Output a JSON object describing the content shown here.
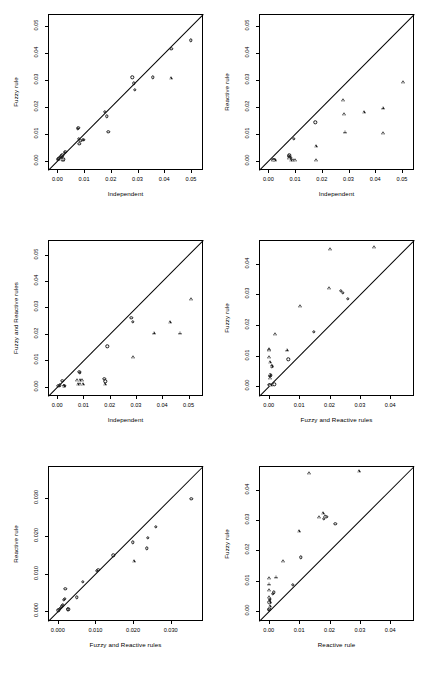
{
  "figure": {
    "type": "scatter-matrix",
    "panel_count": 6,
    "marker_names": [
      "circle-marker",
      "triangle-marker"
    ],
    "reference_line": "y = x identity line"
  },
  "chart_data": [
    {
      "id": "panel-1",
      "type": "scatter",
      "title": "",
      "xlabel": "Independent",
      "ylabel": "Fuzzy rule",
      "xlim": [
        -0.0035,
        0.0545
      ],
      "ylim": [
        -0.0035,
        0.0545
      ],
      "xticks": [
        0.0,
        0.01,
        0.02,
        0.03,
        0.04,
        0.05
      ],
      "xticklabels": [
        "0.00",
        "0.01",
        "0.02",
        "0.03",
        "0.04",
        "0.05"
      ],
      "yticks": [
        0.0,
        0.01,
        0.02,
        0.03,
        0.04,
        0.05
      ],
      "yticklabels": [
        "0.00",
        "0.01",
        "0.02",
        "0.03",
        "0.04",
        "0.05"
      ],
      "grid": false,
      "legend": "none",
      "identity_line": true,
      "series": [
        {
          "name": "circle",
          "marker": "circle",
          "points": [
            [
              0.0002,
              0.0004
            ],
            [
              0.0004,
              0.0006
            ],
            [
              0.0007,
              0.0009
            ],
            [
              0.001,
              0.0011
            ],
            [
              0.0013,
              0.0015
            ],
            [
              0.0015,
              0.0016
            ],
            [
              0.0019,
              0.002
            ],
            [
              0.0021,
              0.0004
            ],
            [
              0.0022,
              0.0005
            ],
            [
              0.0027,
              0.0029
            ],
            [
              0.003,
              0.0032
            ],
            [
              0.0077,
              0.0119
            ],
            [
              0.0078,
              0.0121
            ],
            [
              0.0081,
              0.0081
            ],
            [
              0.0082,
              0.0063
            ],
            [
              0.0086,
              0.0073
            ],
            [
              0.0095,
              0.0077
            ],
            [
              0.0099,
              0.0078
            ],
            [
              0.0177,
              0.0182
            ],
            [
              0.0184,
              0.0164
            ],
            [
              0.019,
              0.0106
            ],
            [
              0.0281,
              0.0309
            ],
            [
              0.0285,
              0.0287
            ],
            [
              0.0289,
              0.0263
            ],
            [
              0.0358,
              0.0309
            ],
            [
              0.0427,
              0.0416
            ],
            [
              0.05,
              0.0447
            ]
          ]
        },
        {
          "name": "triangle",
          "marker": "triangle",
          "points": [
            [
              0.0014,
              0.0006
            ],
            [
              0.0022,
              0.0004
            ],
            [
              0.0425,
              0.0306
            ]
          ]
        }
      ]
    },
    {
      "id": "panel-2",
      "type": "scatter",
      "title": "",
      "xlabel": "Independent",
      "ylabel": "Reactive rule",
      "xlim": [
        -0.0035,
        0.0545
      ],
      "ylim": [
        -0.0035,
        0.0545
      ],
      "xticks": [
        0.0,
        0.01,
        0.02,
        0.03,
        0.04,
        0.05
      ],
      "xticklabels": [
        "0.00",
        "0.01",
        "0.02",
        "0.03",
        "0.04",
        "0.05"
      ],
      "yticks": [
        0.0,
        0.01,
        0.02,
        0.03,
        0.04,
        0.05
      ],
      "yticklabels": [
        "0.00",
        "0.01",
        "0.02",
        "0.03",
        "0.04",
        "0.05"
      ],
      "grid": false,
      "legend": "none",
      "identity_line": true,
      "series": [
        {
          "name": "circle",
          "marker": "circle",
          "points": [
            [
              0.0019,
              0.0002
            ],
            [
              0.0021,
              0.0002
            ],
            [
              0.0024,
              0.0002
            ],
            [
              0.0077,
              0.0016
            ],
            [
              0.0079,
              0.0019
            ],
            [
              0.0081,
              0.0014
            ],
            [
              0.0083,
              0.001
            ],
            [
              0.0096,
              0.008
            ],
            [
              0.0176,
              0.0143
            ]
          ]
        },
        {
          "name": "triangle",
          "marker": "triangle",
          "points": [
            [
              0.0018,
              0.0001
            ],
            [
              0.0023,
              0.0001
            ],
            [
              0.0079,
              0.0009
            ],
            [
              0.0083,
              0.0003
            ],
            [
              0.0093,
              0.0002
            ],
            [
              0.01,
              0.0002
            ],
            [
              0.0178,
              0.0055
            ],
            [
              0.018,
              0.0001
            ],
            [
              0.0281,
              0.0224
            ],
            [
              0.0284,
              0.0173
            ],
            [
              0.0288,
              0.0108
            ],
            [
              0.0357,
              0.0181
            ],
            [
              0.0428,
              0.0197
            ],
            [
              0.043,
              0.0103
            ],
            [
              0.0504,
              0.0293
            ]
          ]
        }
      ]
    },
    {
      "id": "panel-3",
      "type": "scatter",
      "title": "",
      "xlabel": "Independent",
      "ylabel": "Fuzzy and Reactive rules",
      "xlim": [
        -0.0035,
        0.0555
      ],
      "ylim": [
        -0.0035,
        0.0555
      ],
      "xticks": [
        0.0,
        0.01,
        0.02,
        0.03,
        0.04,
        0.05
      ],
      "xticklabels": [
        "0.00",
        "0.01",
        "0.02",
        "0.03",
        "0.04",
        "0.05"
      ],
      "yticks": [
        0.0,
        0.01,
        0.02,
        0.03,
        0.04,
        0.05
      ],
      "yticklabels": [
        "0.00",
        "0.01",
        "0.02",
        "0.03",
        "0.04",
        "0.05"
      ],
      "grid": false,
      "legend": "none",
      "identity_line": true,
      "series": [
        {
          "name": "circle",
          "marker": "circle",
          "points": [
            [
              0.0004,
              0.0003
            ],
            [
              0.001,
              0.0005
            ],
            [
              0.0019,
              0.0023
            ],
            [
              0.0024,
              0.0004
            ],
            [
              0.0026,
              0.0004
            ],
            [
              0.0028,
              0.0004
            ],
            [
              0.0084,
              0.0057
            ],
            [
              0.0087,
              0.0052
            ],
            [
              0.018,
              0.003
            ],
            [
              0.0183,
              0.0021
            ],
            [
              0.019,
              0.0153
            ],
            [
              0.0282,
              0.0261
            ],
            [
              0.0287,
              0.0246
            ]
          ]
        },
        {
          "name": "triangle",
          "marker": "triangle",
          "points": [
            [
              0.0025,
              0.0004
            ],
            [
              0.0076,
              0.0026
            ],
            [
              0.0079,
              0.0011
            ],
            [
              0.0086,
              0.0026
            ],
            [
              0.0088,
              0.001
            ],
            [
              0.0095,
              0.0026
            ],
            [
              0.0097,
              0.001
            ],
            [
              0.0181,
              0.001
            ],
            [
              0.0289,
              0.0111
            ],
            [
              0.0368,
              0.0205
            ],
            [
              0.0428,
              0.0243
            ],
            [
              0.0468,
              0.0205
            ],
            [
              0.0511,
              0.0331
            ]
          ]
        }
      ]
    },
    {
      "id": "panel-4",
      "type": "scatter",
      "title": "",
      "xlabel": "Fuzzy and Reactive rules",
      "ylabel": "Fuzzy rule",
      "xlim": [
        -0.0032,
        0.0478
      ],
      "ylim": [
        -0.0032,
        0.0478
      ],
      "xticks": [
        0.0,
        0.01,
        0.02,
        0.03,
        0.04
      ],
      "xticklabels": [
        "0.00",
        "0.01",
        "0.02",
        "0.03",
        "0.04"
      ],
      "yticks": [
        0.0,
        0.01,
        0.02,
        0.03,
        0.04
      ],
      "yticklabels": [
        "0.00",
        "0.01",
        "0.02",
        "0.03",
        "0.04"
      ],
      "grid": false,
      "legend": "none",
      "identity_line": true,
      "series": [
        {
          "name": "circle",
          "marker": "circle",
          "points": [
            [
              0.0002,
              0.0004
            ],
            [
              0.0003,
              0.0005
            ],
            [
              0.0004,
              0.0035
            ],
            [
              0.0005,
              0.0036
            ],
            [
              0.001,
              0.0063
            ],
            [
              0.0011,
              0.0067
            ],
            [
              0.0018,
              0.0006
            ],
            [
              0.0064,
              0.0088
            ],
            [
              0.0148,
              0.0177
            ],
            [
              0.0238,
              0.0311
            ],
            [
              0.0243,
              0.0306
            ],
            [
              0.0261,
              0.0286
            ]
          ]
        },
        {
          "name": "triangle",
          "marker": "triangle",
          "points": [
            [
              0.0001,
              0.0121
            ],
            [
              0.0002,
              0.0117
            ],
            [
              0.0002,
              0.0094
            ],
            [
              0.0003,
              0.0079
            ],
            [
              0.0004,
              0.0038
            ],
            [
              0.0005,
              0.0027
            ],
            [
              0.0007,
              0.0005
            ],
            [
              0.001,
              0.0065
            ],
            [
              0.0021,
              0.0171
            ],
            [
              0.006,
              0.012
            ],
            [
              0.0103,
              0.0262
            ],
            [
              0.0199,
              0.0322
            ],
            [
              0.0203,
              0.0449
            ],
            [
              0.0348,
              0.0456
            ]
          ]
        }
      ]
    },
    {
      "id": "panel-5",
      "type": "scatter",
      "title": "",
      "xlabel": "Fuzzy and Reactive rules",
      "ylabel": "Reactive rule",
      "xlim": [
        -0.0026,
        0.0386
      ],
      "ylim": [
        -0.0026,
        0.0386
      ],
      "xticks": [
        0.0,
        0.01,
        0.02,
        0.03
      ],
      "xticklabels": [
        "0.000",
        "0.010",
        "0.020",
        "0.030"
      ],
      "yticks": [
        0.0,
        0.01,
        0.02,
        0.03
      ],
      "yticklabels": [
        "0.000",
        "0.010",
        "0.020",
        "0.030"
      ],
      "grid": false,
      "legend": "none",
      "identity_line": true,
      "series": [
        {
          "name": "circle",
          "marker": "circle",
          "points": [
            [
              0.0001,
              0.0002
            ],
            [
              0.0003,
              0.0004
            ],
            [
              0.0005,
              0.0006
            ],
            [
              0.0008,
              0.0009
            ],
            [
              0.0011,
              0.0013
            ],
            [
              0.0013,
              0.0016
            ],
            [
              0.0016,
              0.003
            ],
            [
              0.0019,
              0.0033
            ],
            [
              0.002,
              0.006
            ],
            [
              0.0026,
              0.0005
            ],
            [
              0.0028,
              0.0005
            ],
            [
              0.0051,
              0.0037
            ],
            [
              0.0067,
              0.0078
            ],
            [
              0.0104,
              0.0108
            ],
            [
              0.0108,
              0.011
            ],
            [
              0.0148,
              0.0149
            ],
            [
              0.0199,
              0.0183
            ],
            [
              0.0236,
              0.0167
            ],
            [
              0.024,
              0.0195
            ],
            [
              0.026,
              0.0224
            ],
            [
              0.0355,
              0.0299
            ]
          ]
        },
        {
          "name": "triangle",
          "marker": "triangle",
          "points": [
            [
              0.0202,
              0.0134
            ]
          ]
        }
      ]
    },
    {
      "id": "panel-6",
      "type": "scatter",
      "title": "",
      "xlabel": "Reactive rule",
      "ylabel": "Fuzzy rule",
      "xlim": [
        -0.0032,
        0.0478
      ],
      "ylim": [
        -0.0032,
        0.0478
      ],
      "xticks": [
        0.0,
        0.01,
        0.02,
        0.03,
        0.04
      ],
      "xticklabels": [
        "0.00",
        "0.01",
        "0.02",
        "0.03",
        "0.04"
      ],
      "yticks": [
        0.0,
        0.01,
        0.02,
        0.03,
        0.04
      ],
      "yticklabels": [
        "0.00",
        "0.01",
        "0.02",
        "0.03",
        "0.04"
      ],
      "grid": false,
      "legend": "none",
      "identity_line": true,
      "series": [
        {
          "name": "circle",
          "marker": "circle",
          "points": [
            [
              0.0001,
              0.0004
            ],
            [
              0.0002,
              0.0006
            ],
            [
              0.0002,
              0.003
            ],
            [
              0.0003,
              0.0038
            ],
            [
              0.0004,
              0.0041
            ],
            [
              0.0014,
              0.0057
            ],
            [
              0.0016,
              0.0062
            ],
            [
              0.008,
              0.0087
            ],
            [
              0.0105,
              0.0177
            ],
            [
              0.0181,
              0.0305
            ],
            [
              0.0189,
              0.031
            ],
            [
              0.0219,
              0.0287
            ]
          ]
        },
        {
          "name": "triangle",
          "marker": "triangle",
          "points": [
            [
              0.0001,
              0.011
            ],
            [
              0.0001,
              0.0091
            ],
            [
              0.0002,
              0.007
            ],
            [
              0.0002,
              0.0048
            ],
            [
              0.0003,
              0.003
            ],
            [
              0.0004,
              0.0018
            ],
            [
              0.0024,
              0.0114
            ],
            [
              0.0047,
              0.0166
            ],
            [
              0.0098,
              0.0264
            ],
            [
              0.0167,
              0.0311
            ],
            [
              0.0178,
              0.0322
            ],
            [
              0.0186,
              0.0313
            ],
            [
              0.0134,
              0.0456
            ],
            [
              0.0296,
              0.0462
            ]
          ]
        }
      ]
    }
  ]
}
